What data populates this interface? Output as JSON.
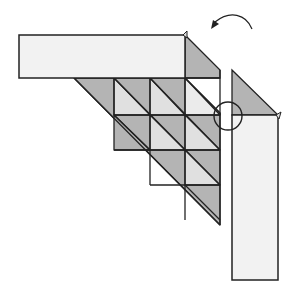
{
  "diagram": {
    "colors": {
      "paper_light": "#f2f2f2",
      "paper_mid": "#e0e0e0",
      "paper_dark": "#b4b4b4",
      "stroke": "#222222",
      "background": "#ffffff"
    },
    "elements": [
      {
        "name": "top-strip",
        "type": "rectangle",
        "fill": "paper_light"
      },
      {
        "name": "triangle-grid",
        "type": "triangular-grid",
        "rows": 4,
        "fill_alternating": [
          "paper_dark",
          "paper_mid"
        ]
      },
      {
        "name": "right-strip",
        "type": "rectangle",
        "fill": "paper_light"
      },
      {
        "name": "right-strip-flap",
        "type": "triangle",
        "fill": "paper_dark"
      },
      {
        "name": "focus-circle",
        "type": "circle"
      },
      {
        "name": "rotate-arrow",
        "type": "curved-arrow",
        "direction": "counterclockwise"
      }
    ]
  }
}
